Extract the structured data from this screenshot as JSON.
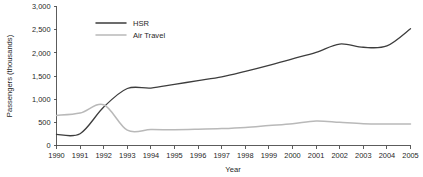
{
  "chart_data": {
    "type": "line",
    "title": "",
    "xlabel": "Year",
    "ylabel": "Passengers  (thousands)",
    "x": [
      1990,
      1991,
      1992,
      1993,
      1994,
      1995,
      1996,
      1997,
      1998,
      1999,
      2000,
      2001,
      2002,
      2003,
      2004,
      2005
    ],
    "xtick_labels": [
      "1990",
      "1991",
      "1992",
      "1993",
      "1994",
      "1995",
      "1996",
      "1997",
      "1998",
      "1999",
      "2000",
      "2001",
      "2002",
      "2003",
      "2004",
      "2005"
    ],
    "ytick_labels": [
      "0",
      "500",
      "1,000",
      "1,500",
      "2,000",
      "2,500",
      "3,000"
    ],
    "ytick_values": [
      0,
      500,
      1000,
      1500,
      2000,
      2500,
      3000
    ],
    "xlim": [
      1990,
      2005
    ],
    "ylim": [
      0,
      3000
    ],
    "grid": false,
    "legend_position": "top-left-inside",
    "series": [
      {
        "name": "HSR",
        "color": "#3d3d3d",
        "values": [
          240,
          255,
          830,
          1230,
          1240,
          1320,
          1400,
          1480,
          1600,
          1730,
          1870,
          2010,
          2190,
          2120,
          2150,
          2520
        ]
      },
      {
        "name": "Air Travel",
        "color": "#b9b9b9",
        "values": [
          650,
          700,
          880,
          330,
          345,
          340,
          350,
          365,
          390,
          430,
          470,
          530,
          500,
          470,
          465,
          465
        ]
      }
    ]
  },
  "legend": {
    "entries": [
      {
        "label": "HSR"
      },
      {
        "label": "Air Travel"
      }
    ]
  },
  "axes": {
    "y_title": "Passengers  (thousands)",
    "x_title": "Year"
  }
}
